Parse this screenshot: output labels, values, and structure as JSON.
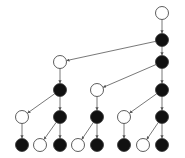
{
  "diagram": {
    "type": "tree",
    "colors": {
      "filled": "#111111",
      "empty": "#ffffff",
      "stroke": "#333333",
      "edge": "#555555"
    },
    "nodes": [
      {
        "id": "n0",
        "x": 162,
        "y": 13,
        "fill": "white"
      },
      {
        "id": "n1",
        "x": 162,
        "y": 40,
        "fill": "black"
      },
      {
        "id": "n2",
        "x": 60,
        "y": 62,
        "fill": "white"
      },
      {
        "id": "n3",
        "x": 162,
        "y": 62,
        "fill": "black"
      },
      {
        "id": "n4",
        "x": 60,
        "y": 90,
        "fill": "black"
      },
      {
        "id": "n5",
        "x": 97,
        "y": 90,
        "fill": "white"
      },
      {
        "id": "n6",
        "x": 162,
        "y": 90,
        "fill": "black"
      },
      {
        "id": "n7",
        "x": 22,
        "y": 117,
        "fill": "white"
      },
      {
        "id": "n8",
        "x": 60,
        "y": 117,
        "fill": "black"
      },
      {
        "id": "n9",
        "x": 97,
        "y": 117,
        "fill": "black"
      },
      {
        "id": "n10",
        "x": 124,
        "y": 117,
        "fill": "white"
      },
      {
        "id": "n11",
        "x": 162,
        "y": 117,
        "fill": "black"
      },
      {
        "id": "n12",
        "x": 22,
        "y": 145,
        "fill": "black"
      },
      {
        "id": "n13",
        "x": 40,
        "y": 145,
        "fill": "white"
      },
      {
        "id": "n14",
        "x": 60,
        "y": 145,
        "fill": "black"
      },
      {
        "id": "n15",
        "x": 78,
        "y": 145,
        "fill": "white"
      },
      {
        "id": "n16",
        "x": 97,
        "y": 145,
        "fill": "black"
      },
      {
        "id": "n17",
        "x": 124,
        "y": 145,
        "fill": "black"
      },
      {
        "id": "n18",
        "x": 143,
        "y": 145,
        "fill": "white"
      },
      {
        "id": "n19",
        "x": 162,
        "y": 145,
        "fill": "black"
      }
    ],
    "edges": [
      [
        "n0",
        "n1"
      ],
      [
        "n1",
        "n2"
      ],
      [
        "n1",
        "n3"
      ],
      [
        "n2",
        "n4"
      ],
      [
        "n3",
        "n5"
      ],
      [
        "n3",
        "n6"
      ],
      [
        "n4",
        "n7"
      ],
      [
        "n4",
        "n8"
      ],
      [
        "n5",
        "n9"
      ],
      [
        "n6",
        "n10"
      ],
      [
        "n6",
        "n11"
      ],
      [
        "n7",
        "n12"
      ],
      [
        "n8",
        "n13"
      ],
      [
        "n8",
        "n14"
      ],
      [
        "n9",
        "n15"
      ],
      [
        "n9",
        "n16"
      ],
      [
        "n10",
        "n17"
      ],
      [
        "n11",
        "n18"
      ],
      [
        "n11",
        "n19"
      ]
    ]
  }
}
